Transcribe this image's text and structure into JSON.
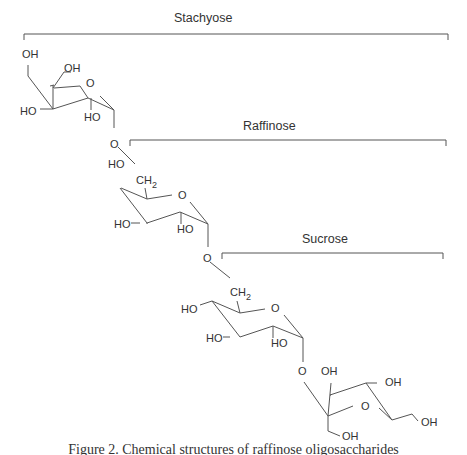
{
  "figure": {
    "brackets": [
      {
        "label": "Stachyose"
      },
      {
        "label": "Raffinose"
      },
      {
        "label": "Sucrose"
      }
    ],
    "ring1": {
      "oh_top": "OH",
      "oh_ch2": "OH",
      "ring_o": "O",
      "ho_left": "HO",
      "ho_bottom": "HO",
      "glyco_o": "O"
    },
    "ring2": {
      "ho_top": "HO",
      "ch2": "CH",
      "ch2_sub": "2",
      "ring_o": "O",
      "ho_left": "HO",
      "ho_bottom": "HO",
      "glyco_o": "O"
    },
    "ring3": {
      "ho_top": "HO",
      "ch2": "CH",
      "ch2_sub": "2",
      "ring_o": "O",
      "ho_left": "HO",
      "ho_bottom": "HO",
      "glyco_o": "O"
    },
    "fructose": {
      "oh_top_left": "OH",
      "oh_top_right": "OH",
      "ring_o": "O",
      "oh_right": "OH",
      "oh_bottom": "OH"
    },
    "caption": "Figure 2.  Chemical structures of raffinose oligosaccharides"
  }
}
